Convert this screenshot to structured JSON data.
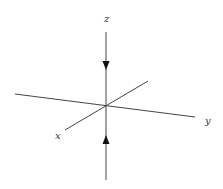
{
  "diagram": {
    "type": "3d-coordinate-axes",
    "labels": {
      "z": "z",
      "x": "x",
      "y": "y"
    },
    "arrows": [
      {
        "name": "top-arrow",
        "direction": "down",
        "description": "arrow on z-axis above origin pointing toward origin"
      },
      {
        "name": "bottom-arrow",
        "direction": "up",
        "description": "arrow on z-axis below origin pointing toward origin"
      }
    ],
    "colors": {
      "line": "#444444",
      "arrow": "#111111",
      "label": "#333333",
      "background": "#ffffff"
    }
  }
}
